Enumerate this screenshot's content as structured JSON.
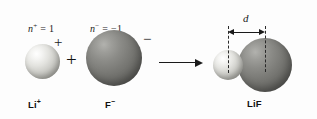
{
  "figure": {
    "background_color": "#fdfdfd"
  },
  "reactants": {
    "cation": {
      "charge_number_label": "n",
      "charge_number_superscript": "+",
      "charge_number_equals": " = 1",
      "sphere_charge_sign": "+",
      "species_label": "Li",
      "species_charge": "+",
      "sphere_color_light": "#f4f4f2",
      "sphere_color_dark": "#8e8e88"
    },
    "anion": {
      "charge_number_label": "n",
      "charge_number_superscript": "−",
      "charge_number_equals": " = −1",
      "sphere_charge_sign": "−",
      "species_label": "F",
      "species_charge": "−",
      "sphere_color_light": "#9d9d99",
      "sphere_color_dark": "#4e4e4b"
    },
    "operator": "+"
  },
  "arrow": {
    "direction": "right",
    "color": "#1a1a1a"
  },
  "product": {
    "species_label": "LiF",
    "distance_label": "d",
    "distance_description": "internuclear distance between Li and F centers"
  }
}
